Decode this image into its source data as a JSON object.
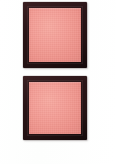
{
  "image": {
    "subject": "blush-compact-swatches",
    "background_color": "#ffffff",
    "width": 116,
    "height": 164,
    "caption": "",
    "items": [
      {
        "id": "swatch-top",
        "label": "",
        "case_color": "#2a1517",
        "powder_color": "#f29a92",
        "shape": "square"
      },
      {
        "id": "swatch-bottom",
        "label": "",
        "case_color": "#2a1517",
        "powder_color": "#f29a92",
        "shape": "square"
      }
    ]
  }
}
